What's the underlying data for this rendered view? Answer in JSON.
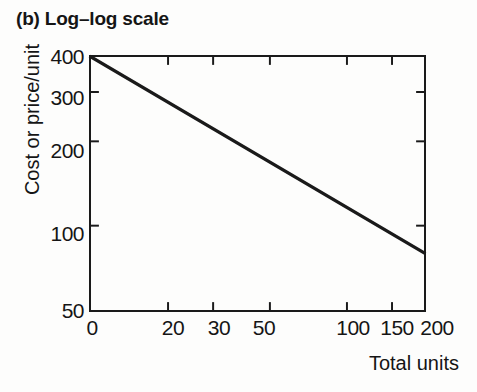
{
  "chart_data": {
    "type": "line",
    "title": "(b) Log–log scale",
    "xlabel": "Total units",
    "ylabel": "Cost or price/unit",
    "xscale": "log",
    "yscale": "log",
    "grid": false,
    "legend": null,
    "xlim": [
      10,
      200
    ],
    "ylim": [
      50,
      400
    ],
    "xticks": [
      {
        "value": 10,
        "label": "0"
      },
      {
        "value": 20,
        "label": "20"
      },
      {
        "value": 30,
        "label": "30"
      },
      {
        "value": 50,
        "label": "50"
      },
      {
        "value": 100,
        "label": "100"
      },
      {
        "value": 150,
        "label": "150"
      },
      {
        "value": 200,
        "label": "200"
      }
    ],
    "yticks": [
      {
        "value": 400,
        "label": "400"
      },
      {
        "value": 300,
        "label": "300"
      },
      {
        "value": 200,
        "label": "200"
      },
      {
        "value": 100,
        "label": "100"
      },
      {
        "value": 50,
        "label": "50"
      }
    ],
    "series": [
      {
        "name": "Experience curve",
        "color": "#1a1a1a",
        "linewidth": 3.4,
        "x": [
          10,
          200
        ],
        "values": [
          400,
          80
        ]
      }
    ],
    "x": [
      10,
      20,
      30,
      50,
      100,
      150,
      200
    ],
    "values": [
      400,
      290,
      236,
      180,
      127,
      103,
      80
    ]
  },
  "axis_style": {
    "frame_color": "#1a1a1a",
    "tick_color": "#1a1a1a",
    "background": "#fdfdfc"
  }
}
